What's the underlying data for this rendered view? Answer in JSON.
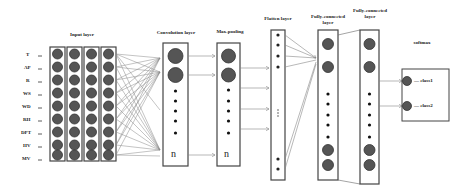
{
  "diagram": {
    "type": "cnn-architecture",
    "layers": [
      {
        "id": "input",
        "title": "Input layer",
        "columns": 4,
        "rows": 9
      },
      {
        "id": "conv",
        "title": "Convolution layer",
        "last_label": "n"
      },
      {
        "id": "pool",
        "title": "Max-pooling",
        "last_label": "n"
      },
      {
        "id": "flatten",
        "title": "Flatten layer",
        "ellipsis": "⋮"
      },
      {
        "id": "fc1",
        "title": "Fully-connected layer"
      },
      {
        "id": "fc2",
        "title": "Fully-connected layer"
      },
      {
        "id": "softmax",
        "title": "softmax"
      }
    ],
    "inputs": [
      "T",
      "AP",
      "R",
      "WS",
      "WD",
      "RH",
      "DPT",
      "HV",
      "MV"
    ],
    "outputs": [
      "class1",
      "class2"
    ],
    "colors": {
      "node": "#555555",
      "node_border": "#333333",
      "line": "#888888",
      "box": "#333333"
    }
  },
  "text": {
    "input_title": "Input layer",
    "conv_title": "Convolution layer",
    "pool_title": "Max-pooling",
    "flatten_title": "Flatten layer",
    "fc1_title_l1": "Fully-connected",
    "fc1_title_l2": "layer",
    "fc2_title_l1": "Fully-connected",
    "fc2_title_l2": "layer",
    "softmax_title": "softmax",
    "conv_n": "n",
    "pool_n": "n",
    "in_T": "T",
    "in_AP": "AP",
    "in_R": "R",
    "in_WS": "WS",
    "in_WD": "WD",
    "in_RH": "RH",
    "in_DPT": "DPT",
    "in_HV": "HV",
    "in_MV": "MV",
    "out_1": "— class1",
    "out_2": "— class2"
  }
}
